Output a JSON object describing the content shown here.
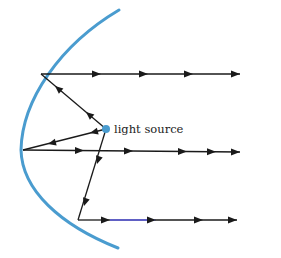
{
  "diagram": {
    "label": "light source",
    "colors": {
      "mirror": "#4a9ccf",
      "ray": "#1a1a1a",
      "source": "#4a9ccf"
    },
    "source_point": [
      106,
      129
    ],
    "reflection_points": [
      {
        "name": "top",
        "point": [
          41,
          74
        ],
        "exit_to": [
          240,
          74
        ]
      },
      {
        "name": "middle",
        "point": [
          23,
          150
        ],
        "exit_to": [
          240,
          152
        ]
      },
      {
        "name": "bottom",
        "point": [
          78,
          220
        ],
        "exit_to": [
          237,
          220
        ]
      }
    ],
    "ray_count": 3
  }
}
